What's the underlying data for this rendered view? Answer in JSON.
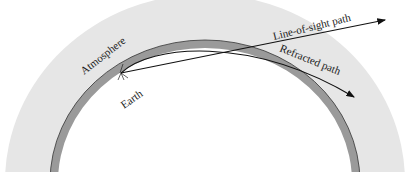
{
  "diagram": {
    "type": "atmospheric-refraction",
    "labels": {
      "atmosphere": "Atmosphere",
      "earth": "Earth",
      "line_of_sight": "Line-of-sight path",
      "refracted": "Refracted path"
    },
    "colors": {
      "atmosphere_fill": "#e6e6e6",
      "earth_band": "#9a9a9a",
      "path_stroke": "#111111",
      "background": "#ffffff"
    }
  }
}
